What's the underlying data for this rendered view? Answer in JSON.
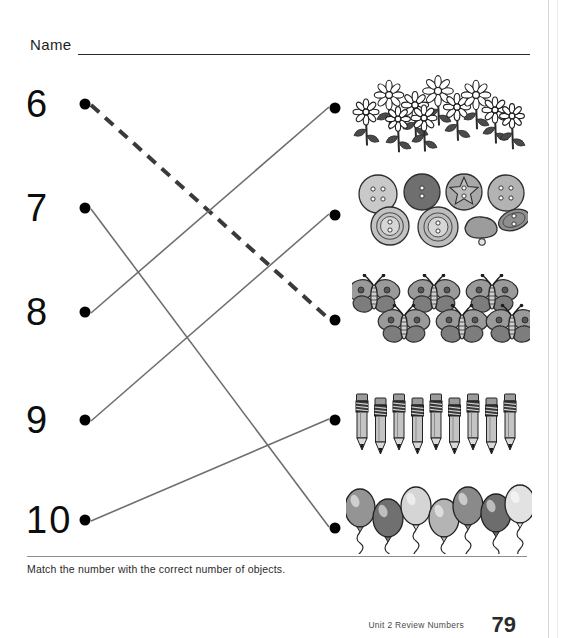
{
  "worksheet": {
    "name_label": "Name",
    "instruction": "Match the number with the correct number of objects.",
    "footer_unit": "Unit 2   Review Numbers",
    "page_number": "79"
  },
  "numbers": [
    {
      "label": "6",
      "y": 104
    },
    {
      "label": "7",
      "y": 208
    },
    {
      "label": "8",
      "y": 312
    },
    {
      "label": "9",
      "y": 420
    },
    {
      "label": "10",
      "y": 520
    }
  ],
  "object_groups": [
    {
      "name": "flowers",
      "count": 10,
      "y": 108
    },
    {
      "name": "buttons",
      "count": 8,
      "y": 215
    },
    {
      "name": "butterflies",
      "count": 6,
      "y": 320
    },
    {
      "name": "pencils",
      "count": 9,
      "y": 420
    },
    {
      "name": "balloons",
      "count": 7,
      "y": 528
    }
  ],
  "connections": [
    {
      "from": "6",
      "to": "butterflies",
      "style": "dashed",
      "color": "#3a3a3a"
    },
    {
      "from": "7",
      "to": "balloons",
      "style": "solid",
      "color": "#6e6e6e"
    },
    {
      "from": "8",
      "to": "flowers",
      "style": "solid",
      "color": "#6e6e6e"
    },
    {
      "from": "9",
      "to": "buttons",
      "style": "solid",
      "color": "#6e6e6e"
    },
    {
      "from": "10",
      "to": "pencils",
      "style": "solid",
      "color": "#6e6e6e"
    }
  ],
  "dots": {
    "left_x": 85,
    "right_x": 335
  },
  "colors": {
    "ink": "#000000",
    "line": "#6e6e6e",
    "dashed_line": "#3a3a3a",
    "rule": "#8e8e8e"
  }
}
